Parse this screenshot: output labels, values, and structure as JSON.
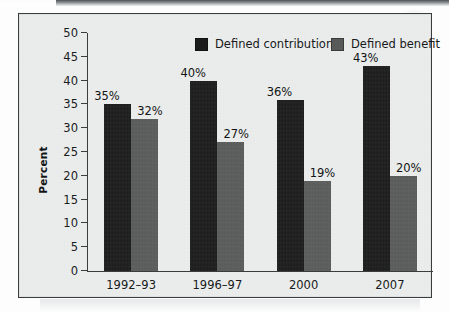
{
  "chart_data": {
    "type": "bar",
    "title": "",
    "subtitle": "",
    "xlabel": "",
    "ylabel": "Percent",
    "ylim": [
      0,
      50
    ],
    "ytick_step": 5,
    "yticks": [
      "50",
      "45",
      "40",
      "35",
      "30",
      "25",
      "20",
      "15",
      "10",
      "5",
      "0"
    ],
    "grid": false,
    "legend_position": "top",
    "categories": [
      "1992–93",
      "1996–97",
      "2000",
      "2007"
    ],
    "series": [
      {
        "name": "Defined contribution",
        "color": "#1b1b1b",
        "values": [
          35,
          40,
          36,
          43
        ],
        "labels": [
          "35%",
          "40%",
          "36%",
          "43%"
        ]
      },
      {
        "name": "Defined benefit",
        "color": "#585a59",
        "values": [
          32,
          27,
          19,
          20
        ],
        "labels": [
          "32%",
          "27%",
          "19%",
          "20%"
        ]
      }
    ]
  },
  "legend": {
    "items": [
      {
        "label": "Defined contribution",
        "swatch": "#1b1b1b"
      },
      {
        "label": "Defined benefit",
        "swatch": "#585a59"
      }
    ]
  },
  "colors": {
    "defined_contribution": "#1b1b1b",
    "defined_benefit": "#585a59",
    "plot_background": "#eceeed",
    "frame_border": "#3a3d3e",
    "axis": "#3a3d3e",
    "text": "#17191a"
  }
}
